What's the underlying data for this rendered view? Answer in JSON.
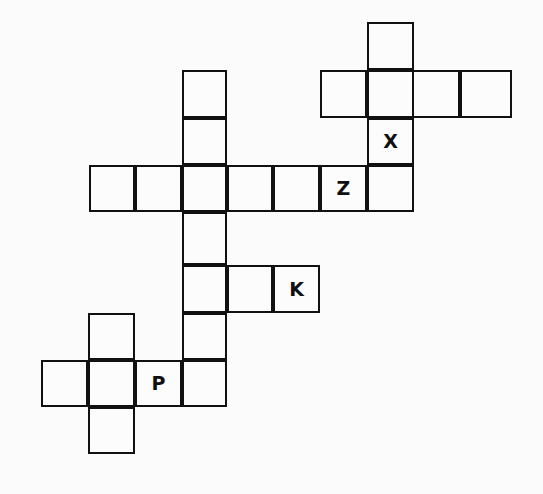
{
  "puzzle": {
    "title": "Crossword Grid",
    "background_color": "#fbfbfb",
    "cell_fill_color": "#fcfcfc",
    "line_color": "#111111",
    "letter_color": "#101010",
    "cell_size": 47,
    "line_width": 2,
    "canvas": {
      "width": 543,
      "height": 494
    },
    "column_edges": [
      41,
      88,
      135,
      182,
      227,
      273,
      320,
      367,
      412,
      460,
      512
    ],
    "row_edges": [
      22,
      70,
      118,
      165,
      212,
      265,
      313,
      360,
      407,
      454
    ],
    "filled_letters": [
      "X",
      "Z",
      "K",
      "P"
    ],
    "letter_count": 4,
    "cell_count": 26,
    "cells": [
      {
        "id": "c1",
        "name": "cell-r0-c7",
        "x": 367,
        "y": 22,
        "w": 47,
        "h": 48,
        "letter": ""
      },
      {
        "id": "c2",
        "name": "cell-r1-c6",
        "x": 320,
        "y": 70,
        "w": 47,
        "h": 48,
        "letter": ""
      },
      {
        "id": "c3",
        "name": "cell-r1-c7",
        "x": 367,
        "y": 70,
        "w": 47,
        "h": 48,
        "letter": ""
      },
      {
        "id": "c4",
        "name": "cell-r1-c8",
        "x": 412,
        "y": 70,
        "w": 48,
        "h": 48,
        "letter": ""
      },
      {
        "id": "c5",
        "name": "cell-r1-c9",
        "x": 460,
        "y": 70,
        "w": 52,
        "h": 48,
        "letter": ""
      },
      {
        "id": "c6",
        "name": "cell-r1-c3",
        "x": 182,
        "y": 70,
        "w": 45,
        "h": 48,
        "letter": ""
      },
      {
        "id": "c7",
        "name": "cell-r2-c3",
        "x": 182,
        "y": 118,
        "w": 45,
        "h": 47,
        "letter": ""
      },
      {
        "id": "c8",
        "name": "cell-r2-c7",
        "x": 367,
        "y": 118,
        "w": 47,
        "h": 47,
        "letter": "X"
      },
      {
        "id": "c9",
        "name": "cell-r3-c0",
        "x": 89,
        "y": 165,
        "w": 46,
        "h": 47,
        "letter": ""
      },
      {
        "id": "c10",
        "name": "cell-r3-c1",
        "x": 135,
        "y": 165,
        "w": 47,
        "h": 47,
        "letter": ""
      },
      {
        "id": "c11",
        "name": "cell-r3-c2",
        "x": 182,
        "y": 165,
        "w": 45,
        "h": 47,
        "letter": ""
      },
      {
        "id": "c12",
        "name": "cell-r3-c3",
        "x": 227,
        "y": 165,
        "w": 46,
        "h": 47,
        "letter": ""
      },
      {
        "id": "c13",
        "name": "cell-r3-c4",
        "x": 273,
        "y": 165,
        "w": 47,
        "h": 47,
        "letter": ""
      },
      {
        "id": "c14",
        "name": "cell-r3-c5",
        "x": 320,
        "y": 165,
        "w": 47,
        "h": 47,
        "letter": "Z"
      },
      {
        "id": "c15",
        "name": "cell-r3-c6",
        "x": 367,
        "y": 165,
        "w": 47,
        "h": 47,
        "letter": ""
      },
      {
        "id": "c16",
        "name": "cell-r4-c3",
        "x": 182,
        "y": 212,
        "w": 45,
        "h": 53,
        "letter": ""
      },
      {
        "id": "c17",
        "name": "cell-r5-c3",
        "x": 182,
        "y": 265,
        "w": 45,
        "h": 48,
        "letter": ""
      },
      {
        "id": "c18",
        "name": "cell-r5-c4",
        "x": 227,
        "y": 265,
        "w": 46,
        "h": 48,
        "letter": ""
      },
      {
        "id": "c19",
        "name": "cell-r5-c5",
        "x": 273,
        "y": 265,
        "w": 47,
        "h": 48,
        "letter": "K"
      },
      {
        "id": "c20",
        "name": "cell-r6-c1",
        "x": 88,
        "y": 313,
        "w": 47,
        "h": 47,
        "letter": ""
      },
      {
        "id": "c21",
        "name": "cell-r6-c3",
        "x": 182,
        "y": 313,
        "w": 45,
        "h": 47,
        "letter": ""
      },
      {
        "id": "c22",
        "name": "cell-r7-c0",
        "x": 41,
        "y": 360,
        "w": 47,
        "h": 47,
        "letter": ""
      },
      {
        "id": "c23",
        "name": "cell-r7-c1",
        "x": 88,
        "y": 360,
        "w": 47,
        "h": 47,
        "letter": ""
      },
      {
        "id": "c24",
        "name": "cell-r7-c2",
        "x": 135,
        "y": 360,
        "w": 47,
        "h": 47,
        "letter": "P"
      },
      {
        "id": "c25",
        "name": "cell-r7-c3",
        "x": 182,
        "y": 360,
        "w": 45,
        "h": 47,
        "letter": ""
      },
      {
        "id": "c26",
        "name": "cell-r8-c1",
        "x": 88,
        "y": 407,
        "w": 47,
        "h": 47,
        "letter": ""
      }
    ]
  }
}
